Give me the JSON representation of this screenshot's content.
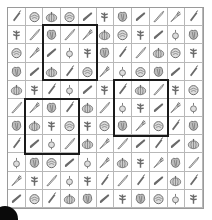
{
  "puzzle": {
    "rows": 11,
    "cols": 11,
    "icon_color": "#6a6a6a",
    "grid": [
      [
        "chili",
        "cabbage",
        "pumpkin",
        "cabbage",
        "cucumber",
        "herb",
        "lettuce",
        "cucumber",
        "leek",
        "carrot",
        "chili"
      ],
      [
        "herb",
        "leek",
        "lettuce",
        "leek",
        "carrot",
        "pumpkin",
        "cabbage",
        "herb",
        "cucumber",
        "radish",
        "lettuce"
      ],
      [
        "cabbage",
        "carrot",
        "cucumber",
        "radish",
        "herb",
        "lettuce",
        "chili",
        "leek",
        "pumpkin",
        "cabbage",
        "herb"
      ],
      [
        "lettuce",
        "cucumber",
        "pumpkin",
        "chili",
        "cabbage",
        "carrot",
        "radish",
        "cabbage",
        "lettuce",
        "cucumber",
        "chili"
      ],
      [
        "pumpkin",
        "herb",
        "chili",
        "radish",
        "cucumber",
        "herb",
        "chili",
        "pumpkin",
        "leek",
        "herb",
        "cabbage"
      ],
      [
        "leek",
        "carrot",
        "lettuce",
        "chili",
        "pumpkin",
        "leek",
        "radish",
        "herb",
        "cucumber",
        "carrot",
        "radish"
      ],
      [
        "lettuce",
        "pumpkin",
        "herb",
        "cabbage",
        "herb",
        "cabbage",
        "lettuce",
        "carrot",
        "cabbage",
        "chili",
        "lettuce"
      ],
      [
        "chili",
        "cucumber",
        "radish",
        "leek",
        "pumpkin",
        "carrot",
        "leek",
        "cucumber",
        "chili",
        "cucumber",
        "pumpkin"
      ],
      [
        "radish",
        "lettuce",
        "cabbage",
        "cucumber",
        "radish",
        "carrot",
        "pumpkin",
        "herb",
        "carrot",
        "lettuce",
        "leek"
      ],
      [
        "carrot",
        "herb",
        "leek",
        "radish",
        "herb",
        "chili",
        "leek",
        "chili",
        "cucumber",
        "pumpkin",
        "chili"
      ],
      [
        "cucumber",
        "cabbage",
        "chili",
        "pumpkin",
        "lettuce",
        "cucumber",
        "herb",
        "lettuce",
        "cabbage",
        "radish",
        "herb"
      ]
    ],
    "highlight_boxes": [
      {
        "col": 2,
        "row": 1,
        "width": 3,
        "height": 3
      },
      {
        "col": 6,
        "row": 4,
        "width": 3,
        "height": 3
      },
      {
        "col": 1,
        "row": 5,
        "width": 3,
        "height": 3
      }
    ]
  }
}
